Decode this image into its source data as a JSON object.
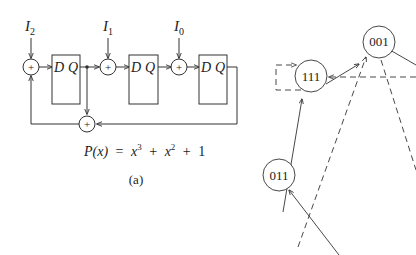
{
  "circuit": {
    "inputs": [
      {
        "name": "I",
        "sub": "2"
      },
      {
        "name": "I",
        "sub": "1"
      },
      {
        "name": "I",
        "sub": "0"
      }
    ],
    "flipflops": [
      {
        "d": "D",
        "q": "Q"
      },
      {
        "d": "D",
        "q": "Q"
      },
      {
        "d": "D",
        "q": "Q"
      }
    ],
    "xor_symbol": "+",
    "polynomial": {
      "lhs": "P(x)",
      "eq": "=",
      "t1_base": "x",
      "t1_exp": "3",
      "plus1": "+",
      "t2_base": "x",
      "t2_exp": "2",
      "plus2": "+",
      "t3": "1"
    },
    "caption": "(a)"
  },
  "state_graph": {
    "states": [
      {
        "label": "001"
      },
      {
        "label": "111"
      },
      {
        "label": "011"
      }
    ]
  },
  "colors": {
    "line": "#333333",
    "text": "#222222",
    "background": "#ffffff"
  }
}
